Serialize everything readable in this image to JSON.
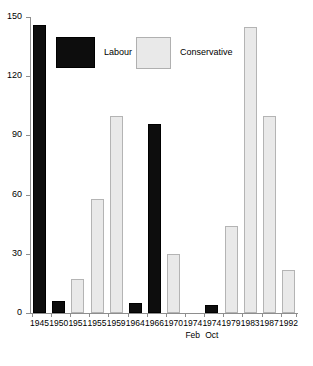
{
  "chart_data": {
    "type": "bar",
    "title": "",
    "subtitle": "",
    "xlabel": "",
    "ylabel": "",
    "ylim": [
      0,
      150
    ],
    "yticks": [
      0,
      30,
      60,
      90,
      120,
      150
    ],
    "grid": false,
    "legend_position": "inside-top-left",
    "categories": [
      "1945",
      "1950",
      "1951",
      "1955",
      "1959",
      "1964",
      "1966",
      "1970",
      "1974",
      "1974",
      "1979",
      "1983",
      "1987",
      "1992"
    ],
    "category_sublabels": [
      "",
      "",
      "",
      "",
      "",
      "",
      "",
      "",
      "Feb",
      "Oct",
      "",
      "",
      "",
      ""
    ],
    "series": [
      {
        "name": "Labour",
        "color": "#0d0d0d",
        "values": [
          146,
          6,
          null,
          null,
          null,
          5,
          96,
          null,
          null,
          4,
          null,
          null,
          null,
          null
        ]
      },
      {
        "name": "Conservative",
        "color": "#e9e9e9",
        "values": [
          null,
          null,
          17,
          58,
          100,
          null,
          null,
          30,
          null,
          null,
          44,
          145,
          100,
          22
        ]
      }
    ],
    "bars": [
      {
        "category": "1945",
        "sublabel": "",
        "party": "Labour",
        "value": 146
      },
      {
        "category": "1950",
        "sublabel": "",
        "party": "Labour",
        "value": 6
      },
      {
        "category": "1951",
        "sublabel": "",
        "party": "Conservative",
        "value": 17
      },
      {
        "category": "1955",
        "sublabel": "",
        "party": "Conservative",
        "value": 58
      },
      {
        "category": "1959",
        "sublabel": "",
        "party": "Conservative",
        "value": 100
      },
      {
        "category": "1964",
        "sublabel": "",
        "party": "Labour",
        "value": 5
      },
      {
        "category": "1966",
        "sublabel": "",
        "party": "Labour",
        "value": 96
      },
      {
        "category": "1970",
        "sublabel": "",
        "party": "Conservative",
        "value": 30
      },
      {
        "category": "1974",
        "sublabel": "Feb",
        "party": "",
        "value": 0
      },
      {
        "category": "1974",
        "sublabel": "Oct",
        "party": "Labour",
        "value": 4
      },
      {
        "category": "1979",
        "sublabel": "",
        "party": "Conservative",
        "value": 44
      },
      {
        "category": "1983",
        "sublabel": "",
        "party": "Conservative",
        "value": 145
      },
      {
        "category": "1987",
        "sublabel": "",
        "party": "Conservative",
        "value": 100
      },
      {
        "category": "1992",
        "sublabel": "",
        "party": "Conservative",
        "value": 22
      }
    ]
  },
  "legend": {
    "entries": [
      {
        "label": "Labour",
        "color": "#0d0d0d"
      },
      {
        "label": "Conservative",
        "color": "#e9e9e9"
      }
    ]
  },
  "axis": {
    "y_tick_labels": [
      "0",
      "30",
      "60",
      "90",
      "120",
      "150"
    ],
    "x_tick_labels": [
      "1945",
      "1950",
      "1951",
      "1955",
      "1959",
      "1964",
      "1966",
      "1970",
      "1974",
      "1974",
      "1979",
      "1983",
      "1987",
      "1992"
    ],
    "x_tick_sublabels": [
      "",
      "",
      "",
      "",
      "",
      "",
      "",
      "",
      "Feb",
      "Oct",
      "",
      "",
      "",
      ""
    ]
  }
}
